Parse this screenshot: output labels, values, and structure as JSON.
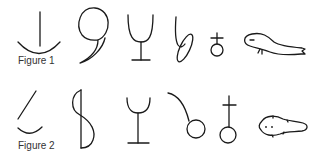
{
  "figures": [
    {
      "label": "Figure 1",
      "glyphs": [
        "anchor-line-over-arc",
        "comma-shape",
        "wine-glass",
        "b-shape-with-oval",
        "circle-with-cross",
        "salamander"
      ]
    },
    {
      "label": "Figure 2",
      "glyphs": [
        "slanted-line-over-arc",
        "s-shape-with-vertical",
        "wine-glass",
        "curve-into-circle",
        "circle-with-tall-cross",
        "tadpole"
      ]
    }
  ],
  "colors": {
    "stroke": "#1a1a1a",
    "background": "#ffffff"
  }
}
